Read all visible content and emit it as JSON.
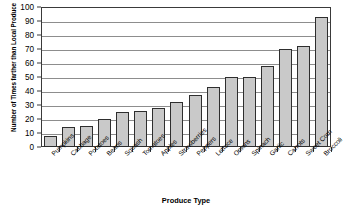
{
  "chart_data": {
    "type": "bar",
    "title": "",
    "xlabel": "Produce Type",
    "ylabel": "Number of Times farther than Local Produce",
    "ylim": [
      0,
      100
    ],
    "yticks": [
      0,
      10,
      20,
      30,
      40,
      50,
      60,
      70,
      80,
      90,
      100
    ],
    "grid": "horizontal",
    "legend": "none",
    "bar_color": "#c9c9c9",
    "bar_edge_color": "#2e2e2e",
    "categories": [
      "Pumpkins",
      "Cabbage",
      "Potatoes",
      "Beans",
      "Squash",
      "Tomatoes",
      "Apples",
      "Strawberries",
      "Peppers",
      "Lettuce",
      "Onions",
      "Spinach",
      "Garlic",
      "Carrots",
      "Sweet Corn",
      "Broccoli"
    ],
    "values": [
      8,
      14,
      15,
      20,
      25,
      26,
      28,
      32,
      37,
      43,
      50,
      50,
      58,
      70,
      72,
      93
    ]
  }
}
